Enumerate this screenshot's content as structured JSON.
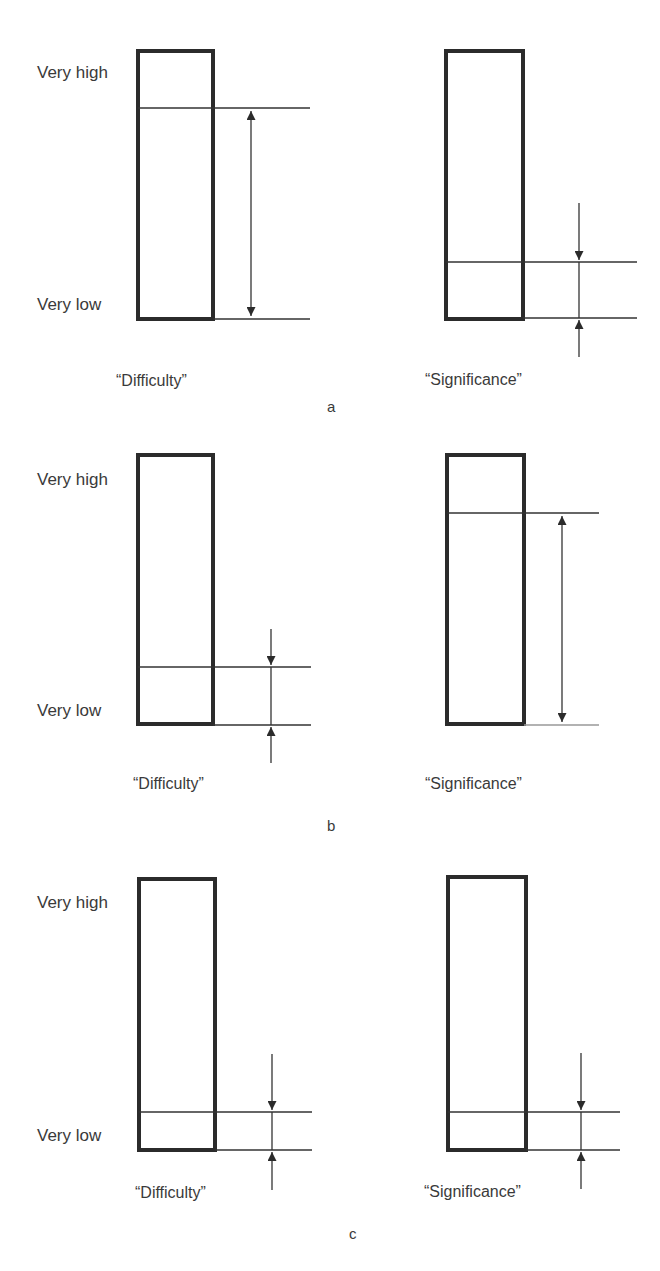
{
  "diagram": {
    "scale_labels": {
      "high": "Very high",
      "low": "Very low"
    },
    "panels": [
      {
        "id": "a",
        "caption": "a",
        "gauges": [
          {
            "name": "difficulty",
            "label": "“Difficulty”",
            "level": "very high",
            "level_fraction": 0.79,
            "arrow_style": "double-headed-span"
          },
          {
            "name": "significance",
            "label": "“Significance”",
            "level": "low",
            "level_fraction": 0.21,
            "arrow_style": "inward-pointing"
          }
        ]
      },
      {
        "id": "b",
        "caption": "b",
        "gauges": [
          {
            "name": "difficulty",
            "label": "“Difficulty”",
            "level": "low",
            "level_fraction": 0.21,
            "arrow_style": "inward-pointing"
          },
          {
            "name": "significance",
            "label": "“Significance”",
            "level": "very high",
            "level_fraction": 0.78,
            "arrow_style": "double-headed-span"
          }
        ]
      },
      {
        "id": "c",
        "caption": "c",
        "gauges": [
          {
            "name": "difficulty",
            "label": "“Difficulty”",
            "level": "low",
            "level_fraction": 0.14,
            "arrow_style": "inward-pointing"
          },
          {
            "name": "significance",
            "label": "“Significance”",
            "level": "low",
            "level_fraction": 0.14,
            "arrow_style": "inward-pointing"
          }
        ]
      }
    ],
    "colors": {
      "box_stroke": "#2b2b2b",
      "line": "#333333",
      "text": "#3a3a3a",
      "background": "#ffffff"
    }
  }
}
